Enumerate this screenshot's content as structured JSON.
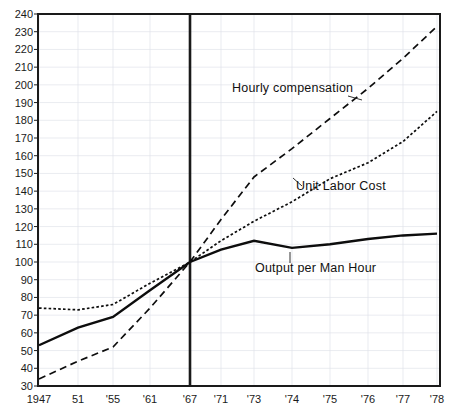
{
  "chart_data": {
    "type": "line",
    "title": "",
    "xlabel": "",
    "ylabel": "",
    "ylim": [
      30,
      240
    ],
    "ytick_step": 10,
    "grid": true,
    "legend": "inline-annotations",
    "index_base": {
      "year": "'67",
      "value": 100
    },
    "categories": [
      "1947",
      "51",
      "'55",
      "'61",
      "'67",
      "'71",
      "'73",
      "'74",
      "'75",
      "'76",
      "'77",
      "'78"
    ],
    "x_positions_px": [
      39,
      78,
      113,
      150,
      190,
      221,
      254,
      292,
      330,
      368,
      403,
      437
    ],
    "yticks": [
      240,
      230,
      220,
      210,
      200,
      190,
      180,
      170,
      160,
      150,
      140,
      130,
      120,
      110,
      100,
      90,
      80,
      70,
      60,
      50,
      40,
      30
    ],
    "series": [
      {
        "name": "Hourly compensation",
        "style": "dashed",
        "label_x": 232,
        "label_y": 92,
        "leader": "M 348 96 L 362 100",
        "values": [
          34,
          44,
          52,
          74,
          100,
          124,
          148,
          164,
          181,
          198,
          215,
          233
        ]
      },
      {
        "name": "Unit Labor Cost",
        "style": "dotted",
        "label_x": 296,
        "label_y": 190,
        "leader": "M 293 178 L 302 186",
        "values": [
          74,
          73,
          76,
          88,
          100,
          112,
          123,
          134,
          147,
          156,
          168,
          185
        ]
      },
      {
        "name": "Output per Man Hour",
        "style": "solid",
        "label_x": 255,
        "label_y": 272,
        "leader": "M 290 252 L 290 263",
        "values": [
          53,
          63,
          69,
          84,
          100,
          107,
          112,
          108,
          110,
          113,
          115,
          116
        ]
      }
    ]
  }
}
